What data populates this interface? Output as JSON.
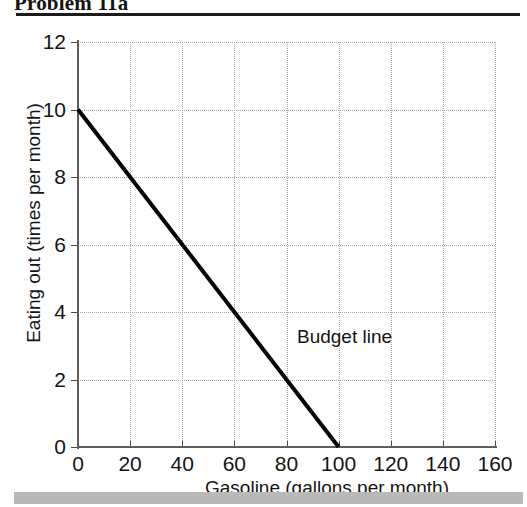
{
  "header": {
    "title": "Problem 11a"
  },
  "chart_data": {
    "type": "line",
    "title": "",
    "xlabel": "Gasoline (gallons per month)",
    "ylabel": "Eating out (times per month)",
    "xlim": [
      0,
      160
    ],
    "ylim": [
      0,
      12
    ],
    "xticks": [
      0,
      20,
      40,
      60,
      80,
      100,
      120,
      140,
      160
    ],
    "xticklabels": [
      "0",
      "20",
      "40",
      "60",
      "80",
      "100",
      "120",
      "140",
      "160"
    ],
    "yticks": [
      0,
      2,
      4,
      6,
      8,
      10,
      12
    ],
    "yticklabels": [
      "0",
      "2",
      "4",
      "6",
      "8",
      "10",
      "12"
    ],
    "grid": true,
    "grid_style": "dotted",
    "legend": "none",
    "series": [
      {
        "name": "Budget line",
        "label": "Budget line",
        "color": "#000000",
        "linewidth": 4,
        "x": [
          0,
          100
        ],
        "values": [
          10,
          0
        ],
        "annotation": {
          "text": "Budget line",
          "x": 105,
          "y": 2.6
        }
      }
    ]
  },
  "colors": {
    "line": "#000000",
    "axis": "#5d5d5d",
    "grid": "#a8a8a8",
    "rule": "#1b1b1b",
    "footer_bar": "#b9b9b9",
    "text": "#141414"
  }
}
